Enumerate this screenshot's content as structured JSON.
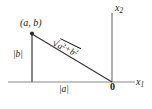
{
  "figure": {
    "kind": "geometry-diagram",
    "colors": {
      "axis": "#8a8a8a",
      "triangle": "#3a3a3a",
      "point": "#2b2b2b",
      "text": "#1a1a1a",
      "background": "#ffffff"
    },
    "labels": {
      "vertex_point": "(a, b)",
      "leg_vertical": "|b|",
      "leg_horizontal": "|a|",
      "origin": "0",
      "axis_x1_name": "x",
      "axis_x1_sub": "1",
      "axis_x2_name": "x",
      "axis_x2_sub": "2",
      "hypotenuse_radical": "√",
      "hypotenuse_term_a": "a",
      "hypotenuse_exp_a": "2",
      "hypotenuse_operator": "+",
      "hypotenuse_term_b": "b",
      "hypotenuse_exp_b": "2"
    },
    "geometry": {
      "origin": [
        112,
        82
      ],
      "vertex_ab": [
        32,
        33
      ],
      "foot": [
        32,
        82
      ],
      "x_axis": [
        8,
        82,
        135,
        82
      ],
      "y_axis": [
        112,
        13,
        112,
        82
      ]
    }
  }
}
